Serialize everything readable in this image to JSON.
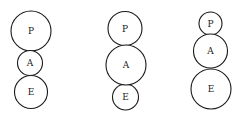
{
  "diagrams": [
    {
      "name": "diagram-1",
      "circles": [
        {
          "label": "P",
          "cx": 31,
          "cy": 31,
          "r": 20
        },
        {
          "label": "A",
          "cx": 30,
          "cy": 63,
          "r": 12.5
        },
        {
          "label": "E",
          "cx": 31,
          "cy": 92,
          "r": 16.5
        }
      ]
    },
    {
      "name": "diagram-2",
      "circles": [
        {
          "label": "P",
          "cx": 125,
          "cy": 28.5,
          "r": 17
        },
        {
          "label": "A",
          "cx": 126,
          "cy": 65,
          "r": 20
        },
        {
          "label": "E",
          "cx": 125.5,
          "cy": 97,
          "r": 13
        }
      ]
    },
    {
      "name": "diagram-3",
      "circles": [
        {
          "label": "P",
          "cx": 210.5,
          "cy": 23.5,
          "r": 11.5
        },
        {
          "label": "A",
          "cx": 210.5,
          "cy": 51,
          "r": 17
        },
        {
          "label": "E",
          "cx": 211,
          "cy": 89,
          "r": 20
        }
      ]
    }
  ]
}
